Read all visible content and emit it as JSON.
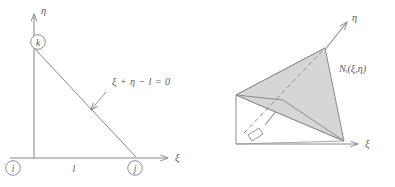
{
  "figure": {
    "background_color": "#ffffff",
    "stroke_color": "#8a8a8a",
    "text_color": "#5a5a5a",
    "shade_fill": "#d6d6d6",
    "left_diagram": {
      "name": "triangular-element-in-natural-coordinates",
      "axis_x_label": "ξ",
      "axis_y_label": "η",
      "node_i_label": "i",
      "node_j_label": "j",
      "node_k_label": "k",
      "edge_length_label": "l",
      "line_equation_label": "ξ + η − l = 0"
    },
    "right_diagram": {
      "name": "shape-function-pyramid",
      "axis_x_label": "ξ",
      "axis_y_label": "η",
      "shape_function_label": "Nᵢ(ξ,η)",
      "right_angle_marker": "right-angle"
    }
  }
}
